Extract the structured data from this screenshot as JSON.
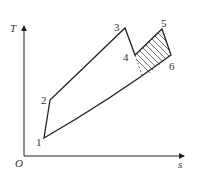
{
  "diagram": {
    "type": "T-s cycle diagram",
    "axes": {
      "y_label": "T",
      "x_label": "s",
      "origin_label": "O"
    },
    "points": [
      {
        "label": "1",
        "x": 44,
        "y": 138
      },
      {
        "label": "2",
        "x": 50,
        "y": 100
      },
      {
        "label": "3",
        "x": 125,
        "y": 28
      },
      {
        "label": "4",
        "x": 135,
        "y": 55
      },
      {
        "label": "5",
        "x": 162,
        "y": 29
      },
      {
        "label": "6",
        "x": 171,
        "y": 55
      }
    ],
    "hatched_region": "area 4-5-6 bounded by lower curve",
    "colors": {
      "line": "#222222",
      "hatch": "#333333",
      "text": "#333333"
    }
  }
}
